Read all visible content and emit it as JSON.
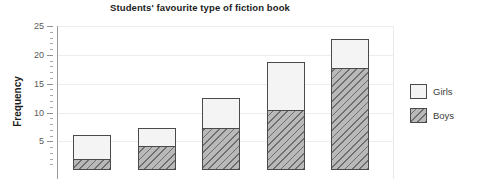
{
  "chart_data": {
    "type": "bar",
    "subtype": "stacked-bar",
    "title": "Students' favourite type of fiction book",
    "xlabel": "",
    "ylabel": "Frequency",
    "ylim": [
      0,
      25
    ],
    "ytick_labels": [
      "5",
      "10",
      "15",
      "20",
      "25"
    ],
    "ytick_values": [
      5,
      10,
      15,
      20,
      25
    ],
    "ytick_minor_step": 1,
    "grid": true,
    "grid_axis": "y",
    "legend_position": "right",
    "categories": [
      "",
      "",
      "",
      "",
      ""
    ],
    "series": [
      {
        "name": "Boys",
        "values": [
          2.0,
          4.2,
          7.4,
          10.5,
          17.8
        ]
      },
      {
        "name": "Girls",
        "values": [
          4.1,
          3.1,
          5.1,
          8.2,
          5.0
        ]
      }
    ],
    "totals": [
      6.1,
      7.3,
      12.5,
      18.7,
      22.8
    ],
    "note_cropped": "bottom of plot and x-axis category labels are cut off by the screenshot edge"
  },
  "axis": {
    "y_title": "Frequency",
    "ticks": [
      {
        "label": "25",
        "value": 25
      },
      {
        "label": "20",
        "value": 20
      },
      {
        "label": "15",
        "value": 15
      },
      {
        "label": "10",
        "value": 10
      },
      {
        "label": "5",
        "value": 5
      }
    ]
  },
  "legend": {
    "entries": [
      {
        "label": "Girls",
        "pattern": "solid-light",
        "color": "#f4f4f4"
      },
      {
        "label": "Boys",
        "pattern": "diagonal-hatch",
        "color": "#b9b9b9"
      }
    ]
  },
  "colors": {
    "girls_fill": "#f4f4f4",
    "boys_fill": "#b9b9b9",
    "bar_outline": "#4a4a4a",
    "gridline": "#ededed",
    "axis": "#9a9a9a",
    "text": "#1d1d1d"
  }
}
